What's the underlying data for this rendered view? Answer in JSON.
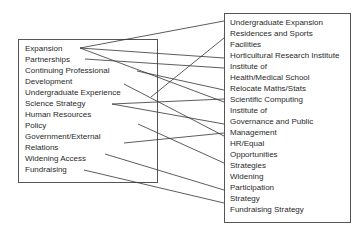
{
  "diagram": {
    "type": "mapping",
    "left_box": {
      "items": [
        "Expansion",
        "Partnerships",
        "Continuing Professional",
        "Development",
        "Undergraduate Experience",
        "Science Strategy",
        "Human Resources",
        "Policy",
        "Government/External",
        "Relations",
        "Widening Access",
        "Fundraising"
      ]
    },
    "right_box": {
      "items": [
        "Undergraduate Expansion",
        "Residences and Sports",
        "Facilities",
        "Horticultural Research Institute",
        "Institute of",
        "Health/Medical School",
        "Relocate Maths/Stats",
        "Scientific Computing",
        "Institute of",
        "Governance and Public",
        "Management",
        "HR/Equal",
        "Opportunities",
        "Strategies",
        "Widening",
        "Participation",
        "Strategy",
        "Fundraising Strategy"
      ]
    },
    "connections": [
      {
        "from": "Expansion",
        "to": "Undergraduate Expansion"
      },
      {
        "from": "Expansion",
        "to": "Horticultural Research Institute"
      },
      {
        "from": "Expansion",
        "to": "Scientific Computing"
      },
      {
        "from": "Partnerships",
        "to": "Institute of Health/Medical School"
      },
      {
        "from": "Continuing Professional Development",
        "to": "Relocate Maths/Stats"
      },
      {
        "from": "Undergraduate Experience",
        "to": "Residences and Sports Facilities"
      },
      {
        "from": "Undergraduate Experience",
        "to": "Institute of Governance and Public Management"
      },
      {
        "from": "Science Strategy",
        "to": "Scientific Computing"
      },
      {
        "from": "Science Strategy",
        "to": "Institute of Governance and Public Management"
      },
      {
        "from": "Human Resources Policy",
        "to": "HR/Equal Opportunities Strategies"
      },
      {
        "from": "Government/External Relations",
        "to": "Institute of Governance and Public Management"
      },
      {
        "from": "Widening Access",
        "to": "Widening Participation Strategy"
      },
      {
        "from": "Fundraising",
        "to": "Fundraising Strategy"
      }
    ]
  }
}
